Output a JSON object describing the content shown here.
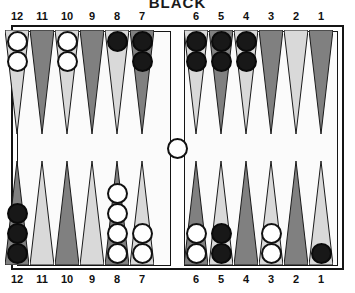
{
  "title": "BLACK",
  "colors": {
    "point_light": "#d9d9d9",
    "point_dark": "#808080",
    "checker_white": "#ffffff",
    "checker_black": "#181818",
    "frame": "#151515",
    "board_bg": "#fbfbfb",
    "text": "#111111"
  },
  "labels": {
    "top": [
      "12",
      "11",
      "10",
      "9",
      "8",
      "7",
      "6",
      "5",
      "4",
      "3",
      "2",
      "1"
    ],
    "bottom": [
      "12",
      "11",
      "10",
      "9",
      "8",
      "7",
      "6",
      "5",
      "4",
      "3",
      "2",
      "1"
    ]
  },
  "board": {
    "bar": {
      "white": 1,
      "black": 0
    },
    "top_points": [
      {
        "label": "12",
        "shade": "light",
        "checkers": 2,
        "color": "white"
      },
      {
        "label": "11",
        "shade": "dark",
        "checkers": 0,
        "color": "none"
      },
      {
        "label": "10",
        "shade": "light",
        "checkers": 2,
        "color": "white"
      },
      {
        "label": "9",
        "shade": "dark",
        "checkers": 0,
        "color": "none"
      },
      {
        "label": "8",
        "shade": "light",
        "checkers": 1,
        "color": "black"
      },
      {
        "label": "7",
        "shade": "dark",
        "checkers": 2,
        "color": "black"
      },
      {
        "label": "6",
        "shade": "light",
        "checkers": 2,
        "color": "black"
      },
      {
        "label": "5",
        "shade": "dark",
        "checkers": 2,
        "color": "black"
      },
      {
        "label": "4",
        "shade": "light",
        "checkers": 2,
        "color": "black"
      },
      {
        "label": "3",
        "shade": "dark",
        "checkers": 0,
        "color": "none"
      },
      {
        "label": "2",
        "shade": "light",
        "checkers": 0,
        "color": "none"
      },
      {
        "label": "1",
        "shade": "dark",
        "checkers": 0,
        "color": "none"
      }
    ],
    "bottom_points": [
      {
        "label": "12",
        "shade": "dark",
        "checkers": 3,
        "color": "black"
      },
      {
        "label": "11",
        "shade": "light",
        "checkers": 0,
        "color": "none"
      },
      {
        "label": "10",
        "shade": "dark",
        "checkers": 0,
        "color": "none"
      },
      {
        "label": "9",
        "shade": "light",
        "checkers": 0,
        "color": "none"
      },
      {
        "label": "8",
        "shade": "dark",
        "checkers": 4,
        "color": "white"
      },
      {
        "label": "7",
        "shade": "light",
        "checkers": 2,
        "color": "white"
      },
      {
        "label": "6",
        "shade": "dark",
        "checkers": 2,
        "color": "white"
      },
      {
        "label": "5",
        "shade": "light",
        "checkers": 2,
        "color": "black"
      },
      {
        "label": "4",
        "shade": "dark",
        "checkers": 0,
        "color": "none"
      },
      {
        "label": "3",
        "shade": "light",
        "checkers": 2,
        "color": "white"
      },
      {
        "label": "2",
        "shade": "dark",
        "checkers": 0,
        "color": "none"
      },
      {
        "label": "1",
        "shade": "light",
        "checkers": 1,
        "color": "black"
      }
    ]
  }
}
